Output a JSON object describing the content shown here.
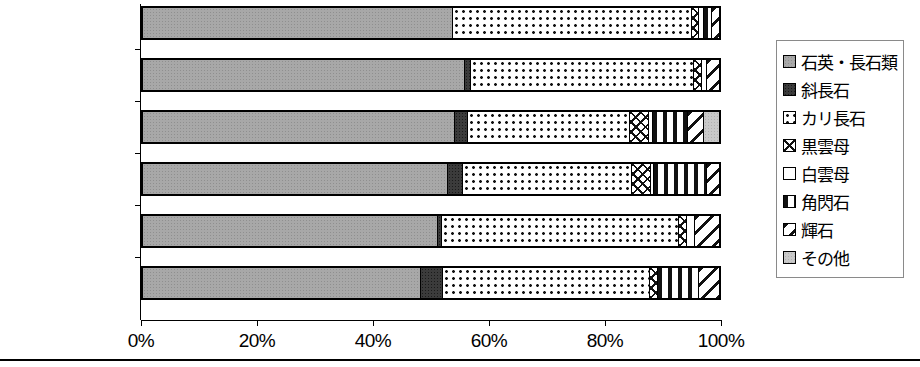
{
  "chart_data": {
    "type": "bar",
    "orientation": "horizontal",
    "stacked": true,
    "normalized_percent": true,
    "title": "",
    "xlabel": "",
    "ylabel": "",
    "xlim": [
      0,
      100
    ],
    "grid": false,
    "legend_position": "right",
    "x_ticks": [
      "0%",
      "20%",
      "40%",
      "60%",
      "80%",
      "100%"
    ],
    "x_tick_values": [
      0,
      20,
      40,
      60,
      80,
      100
    ],
    "categories": [
      "三根29",
      "三根1",
      "下ガヤノキ2",
      "下ガヤノキ1",
      "大田原ヤモト1",
      "大田原ヤモト2"
    ],
    "series": [
      {
        "name": "石英・長石類",
        "pattern": "p-quartz",
        "values": [
          53.6,
          55.7,
          54.0,
          52.8,
          51.0,
          48.1
        ]
      },
      {
        "name": "斜長石",
        "pattern": "p-plag",
        "values": [
          0.0,
          1.0,
          2.2,
          2.6,
          0.7,
          3.8
        ]
      },
      {
        "name": "カリ長石",
        "pattern": "p-kfeld",
        "values": [
          41.6,
          38.8,
          28.1,
          29.3,
          41.2,
          35.9
        ]
      },
      {
        "name": "黒雲母",
        "pattern": "p-biotite",
        "values": [
          1.2,
          1.4,
          3.4,
          3.4,
          1.4,
          1.4
        ]
      },
      {
        "name": "白雲母",
        "pattern": "p-muscovite",
        "values": [
          0.9,
          0.9,
          0.7,
          0.5,
          1.4,
          0.0
        ]
      },
      {
        "name": "角閃石",
        "pattern": "p-hornblende",
        "values": [
          1.4,
          0.0,
          6.0,
          9.1,
          0.0,
          7.2
        ]
      },
      {
        "name": "輝石",
        "pattern": "p-pyroxene",
        "values": [
          1.3,
          2.2,
          2.8,
          2.3,
          4.3,
          3.6
        ]
      },
      {
        "name": "その他",
        "pattern": "p-other",
        "values": [
          0.0,
          0.0,
          2.8,
          0.0,
          0.0,
          0.0
        ]
      }
    ]
  },
  "legend": {
    "items": [
      {
        "label": "石英・長石類",
        "pattern": "p-quartz"
      },
      {
        "label": "斜長石",
        "pattern": "p-plag"
      },
      {
        "label": "カリ長石",
        "pattern": "p-kfeld"
      },
      {
        "label": "黒雲母",
        "pattern": "p-biotite"
      },
      {
        "label": "白雲母",
        "pattern": "p-muscovite"
      },
      {
        "label": "角閃石",
        "pattern": "p-hornblende"
      },
      {
        "label": "輝石",
        "pattern": "p-pyroxene"
      },
      {
        "label": "その他",
        "pattern": "p-other"
      }
    ]
  }
}
